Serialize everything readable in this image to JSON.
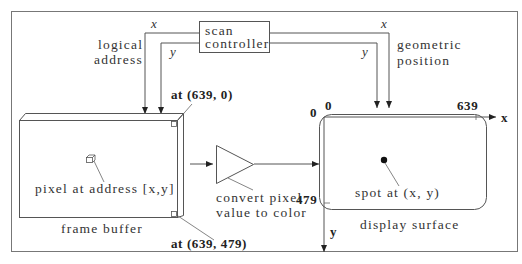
{
  "diagram": {
    "scan_controller": {
      "line1": "scan",
      "line2": "controller"
    },
    "left_wires": {
      "x_label": "x",
      "y_label": "y",
      "caption_line1": "logical",
      "caption_line2": "address"
    },
    "right_wires": {
      "x_label": "x",
      "y_label": "y",
      "caption_line1": "geometric",
      "caption_line2": "position"
    },
    "frame_buffer": {
      "title": "frame buffer",
      "pixel_label": "pixel at address [x,y]",
      "corner_top": "at (639, 0)",
      "corner_bottom": "at (639, 479)"
    },
    "converter": {
      "line1": "convert pixel",
      "line2": "value to color"
    },
    "display_surface": {
      "title": "display surface",
      "spot_label": "spot at (x, y)",
      "origin_x": "0",
      "origin_y": "0",
      "max_x": "639",
      "max_y": "479",
      "x_axis": "x",
      "y_axis": "y"
    }
  },
  "colors": {
    "line": "#555555",
    "text": "#333333",
    "border": "#666666",
    "background": "#ffffff"
  }
}
